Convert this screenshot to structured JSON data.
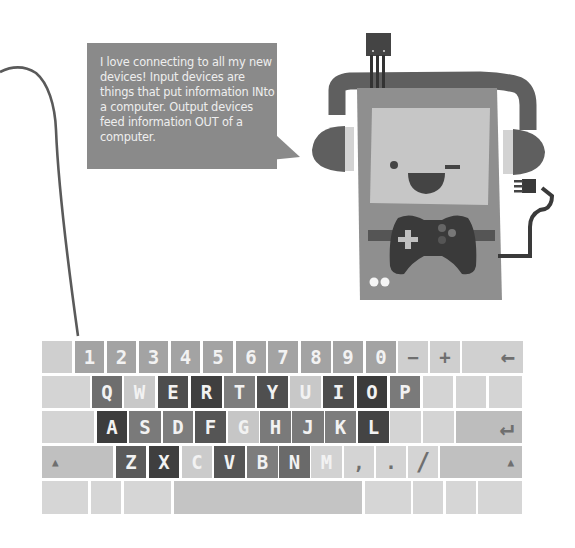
{
  "speech_bubble": {
    "text": "I love connecting to all my new devices! Input devices are things that put information INto a computer. Output devices feed information OUT of a computer."
  },
  "illustration": {
    "character": "computer-with-headphones",
    "face": "winking smile",
    "accessories": [
      "headphones",
      "usb-sensor-chip",
      "game-controller",
      "power-plug-cable"
    ]
  },
  "colors": {
    "bubble": "#8a8a8a",
    "bubble_text": "#eeeeee",
    "cable": "#5a5a5a",
    "body": "#8c8c8c",
    "screen": "#c4c4c4",
    "dark": "#3c3c3c"
  },
  "keyboard": {
    "rows": [
      [
        {
          "label": "",
          "color": "#cfcfcf"
        },
        {
          "label": "1",
          "color": "#a3a3a3"
        },
        {
          "label": "2",
          "color": "#a3a3a3"
        },
        {
          "label": "3",
          "color": "#a3a3a3"
        },
        {
          "label": "4",
          "color": "#a3a3a3"
        },
        {
          "label": "5",
          "color": "#a3a3a3"
        },
        {
          "label": "6",
          "color": "#a3a3a3"
        },
        {
          "label": "7",
          "color": "#a3a3a3"
        },
        {
          "label": "8",
          "color": "#a3a3a3"
        },
        {
          "label": "9",
          "color": "#a3a3a3"
        },
        {
          "label": "0",
          "color": "#a3a3a3"
        },
        {
          "label": "−",
          "color": "#cfcfcf",
          "sym": true
        },
        {
          "label": "+",
          "color": "#cfcfcf",
          "sym": true
        },
        {
          "label": "←",
          "color": "#d0d0d0",
          "sym": true,
          "align": "right"
        }
      ],
      [
        {
          "label": "",
          "color": "#d4d4d4"
        },
        {
          "label": "Q",
          "color": "#6e6e6e"
        },
        {
          "label": "W",
          "color": "#c8c8c8"
        },
        {
          "label": "E",
          "color": "#4d4d4d"
        },
        {
          "label": "R",
          "color": "#3f3f3f"
        },
        {
          "label": "T",
          "color": "#7d7d7d"
        },
        {
          "label": "Y",
          "color": "#4f4f4f"
        },
        {
          "label": "U",
          "color": "#c8c8c8"
        },
        {
          "label": "I",
          "color": "#4d4d4d"
        },
        {
          "label": "O",
          "color": "#3b3b3b"
        },
        {
          "label": "P",
          "color": "#7a7a7a"
        },
        {
          "label": "",
          "color": "#d4d4d4"
        },
        {
          "label": "",
          "color": "#d4d4d4"
        },
        {
          "label": "",
          "color": "#d4d4d4"
        }
      ],
      [
        {
          "label": "",
          "color": "#d4d4d4"
        },
        {
          "label": "A",
          "color": "#3d3d3d"
        },
        {
          "label": "S",
          "color": "#7a7a7a"
        },
        {
          "label": "D",
          "color": "#7d7d7d"
        },
        {
          "label": "F",
          "color": "#555555"
        },
        {
          "label": "G",
          "color": "#c6c6c6"
        },
        {
          "label": "H",
          "color": "#7a7a7a"
        },
        {
          "label": "J",
          "color": "#7a7a7a"
        },
        {
          "label": "K",
          "color": "#7d7d7d"
        },
        {
          "label": "L",
          "color": "#444444"
        },
        {
          "label": "",
          "color": "#d4d4d4"
        },
        {
          "label": "",
          "color": "#d4d4d4"
        },
        {
          "label": "↵",
          "color": "#bdbdbd",
          "sym": true,
          "align": "right"
        }
      ],
      [
        {
          "label": "▲",
          "color": "#c0c0c0",
          "sym": true,
          "align": "left",
          "small": true
        },
        {
          "label": "Z",
          "color": "#5a5a5a"
        },
        {
          "label": "X",
          "color": "#3f3f3f"
        },
        {
          "label": "C",
          "color": "#cbcbcb"
        },
        {
          "label": "V",
          "color": "#555555"
        },
        {
          "label": "B",
          "color": "#7d7d7d"
        },
        {
          "label": "N",
          "color": "#6a6a6a"
        },
        {
          "label": "M",
          "color": "#d2d2d2"
        },
        {
          "label": ",",
          "color": "#d4d4d4",
          "sym": true
        },
        {
          "label": ".",
          "color": "#d4d4d4",
          "sym": true
        },
        {
          "label": "/",
          "color": "#d4d4d4",
          "sym": true
        },
        {
          "label": "▲",
          "color": "#c0c0c0",
          "sym": true,
          "align": "right",
          "small": true
        }
      ],
      [
        {
          "label": "",
          "color": "#d6d6d6"
        },
        {
          "label": "",
          "color": "#d6d6d6"
        },
        {
          "label": "",
          "color": "#d6d6d6"
        },
        {
          "label": "",
          "color": "#c4c4c4"
        },
        {
          "label": "",
          "color": "#d6d6d6"
        },
        {
          "label": "",
          "color": "#d6d6d6"
        },
        {
          "label": "",
          "color": "#d6d6d6"
        },
        {
          "label": "",
          "color": "#d6d6d6"
        }
      ]
    ]
  }
}
